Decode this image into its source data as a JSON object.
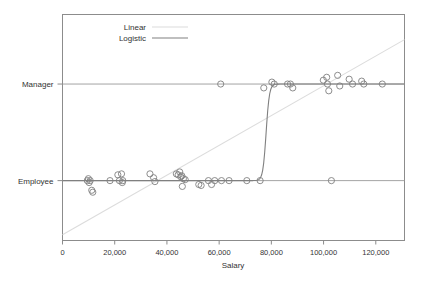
{
  "chart_data": {
    "type": "scatter",
    "title": "",
    "xlabel": "Salary",
    "ylabel": "",
    "xlim": [
      0,
      131000
    ],
    "ylim": [
      -0.62,
      1.72
    ],
    "grid": false,
    "xticks": [
      0,
      20000,
      40000,
      60000,
      80000,
      100000,
      120000
    ],
    "xticklabels": [
      "0",
      "20,000",
      "40,000",
      "60,000",
      "80,000",
      "100,000",
      "120,000"
    ],
    "yticks": [
      0,
      1
    ],
    "yticklabels": [
      "Employee",
      "Manager"
    ],
    "legend": {
      "position": "top-left",
      "entries": [
        {
          "name": "Linear",
          "color": "#dcdcdc",
          "style": "line"
        },
        {
          "name": "Logistic",
          "color": "#808080",
          "style": "line"
        }
      ]
    },
    "marker": {
      "shape": "circle-open",
      "color": "#808080",
      "size": 3.1
    },
    "points": [
      {
        "x": 9500,
        "y": 0.0
      },
      {
        "x": 9900,
        "y": 0.02
      },
      {
        "x": 10200,
        "y": -0.02
      },
      {
        "x": 10600,
        "y": 0.0
      },
      {
        "x": 11200,
        "y": -0.1
      },
      {
        "x": 11600,
        "y": -0.12
      },
      {
        "x": 18200,
        "y": 0.0
      },
      {
        "x": 21200,
        "y": 0.06
      },
      {
        "x": 21800,
        "y": 0.0
      },
      {
        "x": 22600,
        "y": 0.07
      },
      {
        "x": 22900,
        "y": -0.02
      },
      {
        "x": 23100,
        "y": 0.0
      },
      {
        "x": 33500,
        "y": 0.07
      },
      {
        "x": 34900,
        "y": 0.03
      },
      {
        "x": 35400,
        "y": -0.01
      },
      {
        "x": 43600,
        "y": 0.07
      },
      {
        "x": 44300,
        "y": 0.06
      },
      {
        "x": 44900,
        "y": 0.09
      },
      {
        "x": 45300,
        "y": 0.04
      },
      {
        "x": 45700,
        "y": 0.05
      },
      {
        "x": 45900,
        "y": -0.06
      },
      {
        "x": 46300,
        "y": 0.02
      },
      {
        "x": 47000,
        "y": 0.01
      },
      {
        "x": 52200,
        "y": -0.04
      },
      {
        "x": 53100,
        "y": -0.05
      },
      {
        "x": 55900,
        "y": 0.0
      },
      {
        "x": 57100,
        "y": -0.04
      },
      {
        "x": 58300,
        "y": 0.0
      },
      {
        "x": 60600,
        "y": 1.0
      },
      {
        "x": 60900,
        "y": 0.0
      },
      {
        "x": 63800,
        "y": 0.0
      },
      {
        "x": 70600,
        "y": 0.0
      },
      {
        "x": 75700,
        "y": 0.0
      },
      {
        "x": 77100,
        "y": 0.96
      },
      {
        "x": 80200,
        "y": 1.02
      },
      {
        "x": 81100,
        "y": 1.0
      },
      {
        "x": 86200,
        "y": 1.0
      },
      {
        "x": 87300,
        "y": 1.0
      },
      {
        "x": 88200,
        "y": 0.96
      },
      {
        "x": 99900,
        "y": 1.04
      },
      {
        "x": 101200,
        "y": 1.07
      },
      {
        "x": 101500,
        "y": 1.0
      },
      {
        "x": 102000,
        "y": 0.93
      },
      {
        "x": 103000,
        "y": 0.0
      },
      {
        "x": 105400,
        "y": 1.09
      },
      {
        "x": 106200,
        "y": 0.98
      },
      {
        "x": 109800,
        "y": 1.05
      },
      {
        "x": 111100,
        "y": 1.0
      },
      {
        "x": 114600,
        "y": 1.03
      },
      {
        "x": 115400,
        "y": 1.0
      },
      {
        "x": 122500,
        "y": 1.0
      }
    ],
    "series": [
      {
        "name": "Linear",
        "type": "line",
        "color": "#dcdcdc",
        "x": [
          0,
          131000
        ],
        "y": [
          -0.56,
          1.46
        ]
      },
      {
        "name": "Logistic",
        "type": "line",
        "color": "#808080",
        "midpoint": 78000,
        "steepness": 0.0016,
        "x": [
          0,
          131000
        ],
        "y": [
          0.0,
          1.0
        ]
      }
    ]
  }
}
